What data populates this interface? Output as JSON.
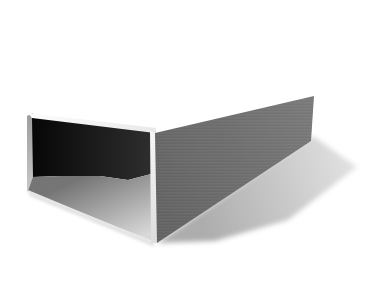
{
  "scene": {
    "type": "3d-render",
    "description": "Monochrome 3D rendering of a hollow open-ended rectangular duct viewed toward its open end, resting on a white ground plane, casting a soft shadow to the lower right, inside a thin gray figure frame",
    "background": "#ffffff",
    "frame": {
      "points": "12,15 363,15 363,277 12,277",
      "stroke": "#7d7d7d"
    },
    "duct": {
      "top_face": {
        "points": "28,113 156,128 156,134 32,118",
        "color_from": "#fdfdfd",
        "color_to": "#e9e9e9"
      },
      "left_edge": {
        "points": "27,116 33,113 33,194 27,191",
        "color_from": "#9c9c9c",
        "color_to": "#c9c9c9"
      },
      "interior_walls": {
        "points": "32,118 155,133 155,173 128,180 100,176 60,176 33,177",
        "color_from": "#070707",
        "color_to": "#2f2f2f"
      },
      "interior_floor": {
        "points": "33,177 60,176 100,176 128,180 155,173 155,242 28,191",
        "color_from": "#757575",
        "color_to": "#d9d9d9"
      },
      "front_bottom_rim": {
        "points": "28,190 153,242 153,245 28,192",
        "color": "#e6e6e6"
      },
      "front_right_rim": {
        "points": "150,131 156,133 158,243 151,243",
        "color_from": "#f7f7f7",
        "color_to": "#dddddd"
      },
      "right_wall": {
        "points": "155,133 314,96 311,141 157,243",
        "color_from": "#626262",
        "color_to": "#787878"
      }
    },
    "shadow": {
      "cast": {
        "points": "157,243 215,241 288,220 357,167 313,136",
        "color_from": "#adadad",
        "color_to": "#e2e2e2"
      },
      "contact": {
        "points": "28,191 153,242 155,247 30,196",
        "color": "#d9d9d9"
      }
    }
  }
}
